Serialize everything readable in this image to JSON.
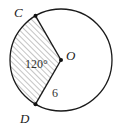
{
  "diagram": {
    "center_label": "O",
    "point_labels": [
      "C",
      "D"
    ],
    "angle_label": "120°",
    "radius_label": "6",
    "angle_degrees": 120,
    "radius_value": 6,
    "colors": {
      "stroke": "#1a1a1a",
      "hatch": "#777777",
      "background": "#ffffff"
    }
  }
}
